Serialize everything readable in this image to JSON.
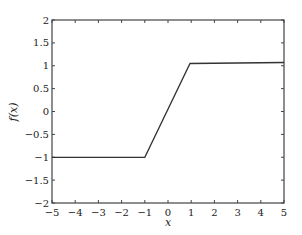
{
  "chart_data": {
    "type": "line",
    "title": "",
    "xlabel": "x",
    "ylabel": "f(x)",
    "xlim": [
      -5,
      5
    ],
    "ylim": [
      -2,
      2
    ],
    "grid": false,
    "legend": null,
    "x_ticks": [
      -5,
      -4,
      -3,
      -2,
      -1,
      0,
      1,
      2,
      3,
      4,
      5
    ],
    "x_tick_labels": [
      "−5",
      "−4",
      "−3",
      "−2",
      "−1",
      "0",
      "1",
      "2",
      "3",
      "4",
      "5"
    ],
    "y_ticks": [
      -2,
      -1.5,
      -1,
      -0.5,
      0,
      0.5,
      1,
      1.5,
      2
    ],
    "y_tick_labels": [
      "−2",
      "−1.5",
      "−1",
      "−0.5",
      "0",
      "0.5",
      "1",
      "1.5",
      "2"
    ],
    "series": [
      {
        "name": "f(x)",
        "color": "#333333",
        "x": [
          -5,
          -1,
          0.95,
          5
        ],
        "y": [
          -1,
          -1,
          1.05,
          1.07
        ]
      }
    ]
  },
  "labels": {
    "xlabel": "x",
    "ylabel": "f(x)"
  }
}
